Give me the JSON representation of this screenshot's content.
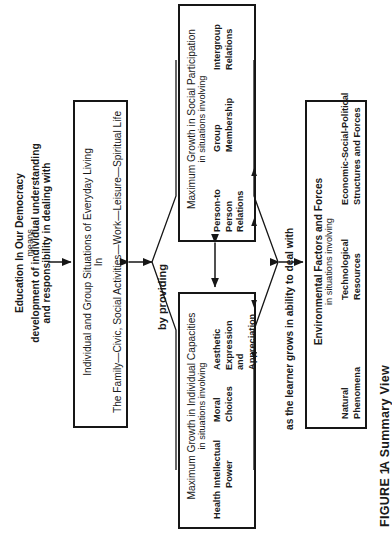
{
  "figure": {
    "caption_label": "FIGURE 1",
    "caption_text": "A Summary View"
  },
  "intro": {
    "line1": "Education In Our Democracy",
    "line2": "means",
    "line3": "development of individual understanding",
    "line4": "and responsibility in dealing with"
  },
  "connectors": {
    "by_providing": "by providing",
    "as_learner_grows": "as the learner grows in ability to deal with"
  },
  "boxes": {
    "everyday_living": {
      "title": "Individual and Group Situations of Everyday Living",
      "connector": "In",
      "detail": "The Family—Civic, Social Activities—Work—Leisure—Spiritual Life"
    },
    "social_participation": {
      "title": "Maximum Growth in Social Participation",
      "subtitle": "in situations involving",
      "items": [
        {
          "lines": [
            "Person-to",
            "Person",
            "Relations"
          ]
        },
        {
          "lines": [
            "Group",
            "Membership"
          ]
        },
        {
          "lines": [
            "Intergroup",
            "Relations"
          ]
        }
      ]
    },
    "individual_capacities": {
      "title": "Maximum Growth in Individual Capacities",
      "subtitle": "in situations involving",
      "items": [
        {
          "lines": [
            "Health"
          ]
        },
        {
          "lines": [
            "Intellectual",
            "Power"
          ]
        },
        {
          "lines": [
            "Moral",
            "Choices"
          ]
        },
        {
          "lines": [
            "Aesthetic",
            "Expression",
            "and",
            "Appreciation"
          ]
        }
      ]
    },
    "environmental_factors": {
      "title": "Environmental Factors and Forces",
      "subtitle": "in situations involving",
      "items": [
        {
          "lines": [
            "Natural",
            "Phenomena"
          ]
        },
        {
          "lines": [
            "Technological",
            "Resources"
          ]
        },
        {
          "lines": [
            "Economic-Social-Political",
            "Structures and Forces"
          ]
        }
      ]
    }
  },
  "colors": {
    "ink": "#161616",
    "paper": "#ffffff"
  }
}
